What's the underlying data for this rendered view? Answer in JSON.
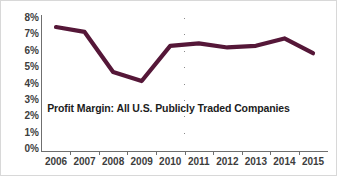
{
  "chart_data": {
    "type": "line",
    "title": "Profit Margin: All U.S. Publicly Traded Companies",
    "xlabel": "",
    "ylabel": "",
    "categories": [
      "2006",
      "2007",
      "2008",
      "2009",
      "2010",
      "2011",
      "2012",
      "2013",
      "2014",
      "2015"
    ],
    "values": [
      7.45,
      7.15,
      4.7,
      4.15,
      6.3,
      6.45,
      6.2,
      6.3,
      6.75,
      5.85
    ],
    "series": [
      {
        "name": "Profit Margin",
        "values": [
          7.45,
          7.15,
          4.7,
          4.15,
          6.3,
          6.45,
          6.2,
          6.3,
          6.75,
          5.85
        ]
      }
    ],
    "ylim": [
      0,
      8
    ],
    "ytick_labels": [
      "8%",
      "7%",
      "6%",
      "5%",
      "4%",
      "3%",
      "2%",
      "1%",
      "0%"
    ],
    "ytick_values": [
      8,
      7,
      6,
      5,
      4,
      3,
      2,
      1,
      0
    ],
    "xtick_labels": [
      "2006",
      "2007",
      "2008",
      "2009",
      "2010",
      "2011",
      "2012",
      "2013",
      "2014",
      "2015"
    ],
    "grid": true,
    "grid_style": "dotted-horizontal",
    "legend": false,
    "legend_position": "none",
    "units": "percent",
    "line_color": "#551738",
    "grid_color": "#8a8a8a",
    "axis_color": "#6f6f6f",
    "label_color": "#3d3d3d",
    "title_color": "#1c1c1c",
    "background_color": "#ffffff",
    "border_color": "#d8d8d8"
  }
}
